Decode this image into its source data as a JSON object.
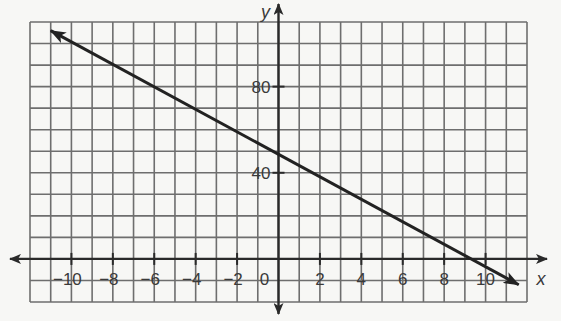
{
  "chart_data": {
    "type": "line",
    "title": "",
    "xlabel": "x",
    "ylabel": "y",
    "xlim": [
      -12,
      12
    ],
    "ylim": [
      -20,
      110
    ],
    "x_grid_step": 1,
    "y_grid_step": 10,
    "grid": true,
    "x_ticks": [
      -10,
      -8,
      -6,
      -4,
      -2,
      0,
      2,
      4,
      6,
      8,
      10
    ],
    "x_tick_labels": [
      "−10",
      "−8",
      "−6",
      "−4",
      "−2",
      "0",
      "2",
      "4",
      "6",
      "8",
      "10"
    ],
    "y_ticks": [
      40,
      80
    ],
    "y_tick_labels": [
      "40",
      "80"
    ],
    "series": [
      {
        "name": "line",
        "x": [
          -11,
          0,
          9.2,
          11.6
        ],
        "y": [
          106,
          44,
          0,
          -12
        ],
        "arrows": "both"
      }
    ],
    "colors": {
      "grid": "#6e6e6e",
      "axis": "#2a2a2a",
      "line": "#222222",
      "background": "#f7f7f5"
    }
  }
}
